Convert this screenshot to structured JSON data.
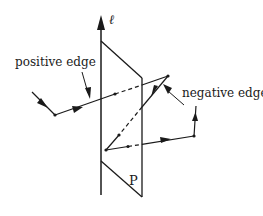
{
  "figure": {
    "axis_label": "ℓ",
    "plane_label": "P",
    "annotations": {
      "positive_edge": "positive edge",
      "negative_edge": "negative edge"
    },
    "colors": {
      "ink": "#1a1a1a",
      "background": "#ffffff"
    }
  }
}
